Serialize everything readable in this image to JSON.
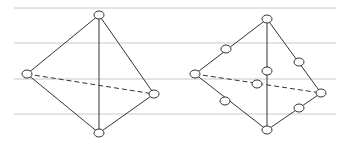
{
  "diagram": {
    "title": "",
    "guide_lines_y": [
      8,
      43,
      79,
      114
    ],
    "guide_line_x": [
      14,
      336
    ],
    "colors": {
      "guide": "#c8c8c8",
      "edge": "#333333",
      "node_fill": "#ffffff",
      "node_stroke": "#333333"
    },
    "left_tetrahedron": {
      "label": "4-node tetrahedron",
      "vertices": [
        [
          99,
          15
        ],
        [
          27,
          74
        ],
        [
          154,
          94
        ],
        [
          99,
          133
        ]
      ],
      "solid_edges": [
        [
          0,
          1
        ],
        [
          0,
          2
        ],
        [
          0,
          3
        ],
        [
          1,
          3
        ],
        [
          2,
          3
        ]
      ],
      "dashed_edges": [
        [
          1,
          2
        ]
      ],
      "nodes": [
        [
          99,
          15
        ],
        [
          27,
          74
        ],
        [
          154,
          94
        ],
        [
          99,
          133
        ]
      ]
    },
    "right_tetrahedron": {
      "label": "10-node tetrahedron",
      "vertices": [
        [
          267,
          19
        ],
        [
          195,
          74
        ],
        [
          321,
          93
        ],
        [
          267,
          130
        ]
      ],
      "solid_edges": [
        [
          0,
          1
        ],
        [
          0,
          2
        ],
        [
          0,
          3
        ],
        [
          1,
          3
        ],
        [
          2,
          3
        ]
      ],
      "dashed_edges": [
        [
          1,
          2
        ]
      ],
      "nodes": [
        [
          267,
          19
        ],
        [
          195,
          74
        ],
        [
          321,
          93
        ],
        [
          267,
          130
        ],
        [
          226,
          49
        ],
        [
          299,
          62
        ],
        [
          267,
          71
        ],
        [
          257,
          84
        ],
        [
          225,
          101
        ],
        [
          299,
          108
        ]
      ]
    }
  }
}
